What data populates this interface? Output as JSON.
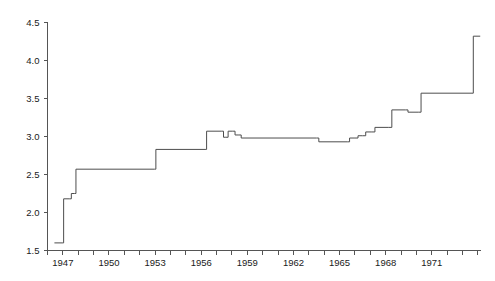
{
  "chart_data": {
    "type": "line",
    "title": "",
    "subtitle": "",
    "xlabel": "",
    "ylabel": "",
    "xlim": [
      1946.0,
      1974.2
    ],
    "ylim": [
      1.5,
      4.5
    ],
    "grid": false,
    "legend": null,
    "step": "post",
    "line_color": "#4d4d4d",
    "axis_color": "#555555",
    "x_ticks": [
      1946,
      1947,
      1948,
      1949,
      1950,
      1951,
      1952,
      1953,
      1954,
      1955,
      1956,
      1957,
      1958,
      1959,
      1960,
      1961,
      1962,
      1963,
      1964,
      1965,
      1966,
      1967,
      1968,
      1969,
      1970,
      1971,
      1972,
      1973,
      1974
    ],
    "x_tick_labels": [
      "",
      "1947",
      "",
      "",
      "1950",
      "",
      "",
      "1953",
      "",
      "",
      "1956",
      "",
      "",
      "1959",
      "",
      "",
      "1962",
      "",
      "",
      "1965",
      "",
      "",
      "1968",
      "",
      "",
      "1971",
      "",
      "",
      ""
    ],
    "y_ticks": [
      1.5,
      2.0,
      2.5,
      3.0,
      3.5,
      4.0,
      4.5
    ],
    "y_tick_labels": [
      "1.5",
      "2.0",
      "2.5",
      "3.0",
      "3.5",
      "4.0",
      "4.5"
    ],
    "series": [
      {
        "name": "series-1",
        "x": [
          1946.45,
          1946.95,
          1947.05,
          1947.45,
          1947.55,
          1947.75,
          1947.85,
          1952.95,
          1953.05,
          1956.25,
          1956.35,
          1957.3,
          1957.45,
          1957.6,
          1957.75,
          1958.05,
          1958.2,
          1958.45,
          1958.6,
          1963.5,
          1963.65,
          1965.5,
          1965.65,
          1966.0,
          1966.2,
          1966.5,
          1966.7,
          1967.1,
          1967.3,
          1968.2,
          1968.4,
          1969.3,
          1969.45,
          1970.15,
          1970.3,
          1973.55,
          1973.7,
          1974.15
        ],
        "y": [
          1.6,
          1.6,
          2.18,
          2.18,
          2.25,
          2.25,
          2.57,
          2.57,
          2.83,
          2.83,
          3.07,
          3.07,
          2.99,
          2.99,
          3.07,
          3.07,
          3.02,
          3.02,
          2.98,
          2.98,
          2.93,
          2.93,
          2.98,
          2.98,
          3.01,
          3.01,
          3.06,
          3.06,
          3.12,
          3.12,
          3.35,
          3.35,
          3.32,
          3.32,
          3.57,
          3.57,
          4.32,
          4.32
        ]
      }
    ]
  }
}
